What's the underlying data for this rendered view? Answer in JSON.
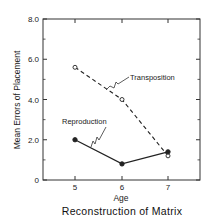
{
  "chart_data": {
    "type": "line",
    "title": "Reconstruction of Matrix",
    "xlabel": "Age",
    "ylabel": "Mean Errors of Placement",
    "x": [
      5,
      6,
      7
    ],
    "xticks": [
      "5",
      "6",
      "7"
    ],
    "yticks": [
      "0",
      "2.0",
      "4.0",
      "6.0",
      "8.0"
    ],
    "ylim": [
      0,
      8
    ],
    "xlim": [
      4.5,
      7.7
    ],
    "grid": false,
    "legend_position": "inline annotations",
    "series": [
      {
        "name": "Transposition",
        "values": [
          5.6,
          4.0,
          1.2
        ],
        "style": "dashed",
        "marker": "open-circle"
      },
      {
        "name": "Reproduction",
        "values": [
          2.0,
          0.8,
          1.4
        ],
        "style": "solid",
        "marker": "filled-circle"
      }
    ],
    "annotations": [
      "Transposition",
      "Reproduction"
    ]
  },
  "colors": {
    "line": "#222222",
    "background": "#ffffff"
  }
}
